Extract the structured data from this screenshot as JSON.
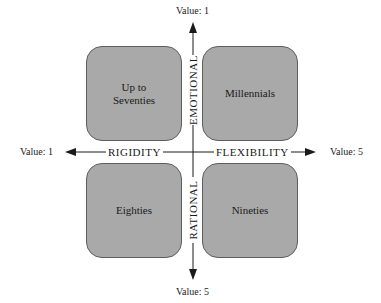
{
  "diagram": {
    "type": "quadrant",
    "quadrants": {
      "top_left": "Up to\nSeventies",
      "top_right": "Millennials",
      "bottom_left": "Eighties",
      "bottom_right": "Nineties"
    },
    "axes": {
      "horizontal": {
        "left_label": "RIGIDITY",
        "right_label": "FLEXIBILITY",
        "left_value": "Value: 1",
        "right_value": "Value: 5"
      },
      "vertical": {
        "top_label": "EMOTIONAL",
        "bottom_label": "RATIONAL",
        "top_value": "Value: 1",
        "bottom_value": "Value: 5"
      }
    },
    "colors": {
      "box_fill": "#a9a9a9",
      "box_border": "#5e5e5e",
      "axis": "#1a1a1a"
    }
  }
}
